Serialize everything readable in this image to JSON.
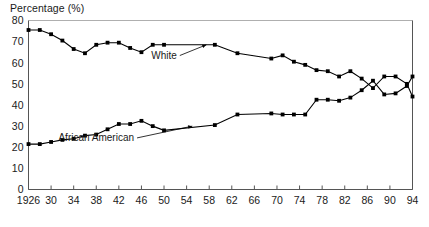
{
  "chart_data": {
    "type": "line",
    "title": "",
    "ylabel": "Percentage (%)",
    "xlabel": "",
    "ylim": [
      0,
      80
    ],
    "ytick_step": 10,
    "yticks": [
      "0",
      "10",
      "20",
      "30",
      "40",
      "50",
      "60",
      "70",
      "80"
    ],
    "xlim": [
      1926,
      1994
    ],
    "xticks": [
      "1926",
      "30",
      "34",
      "38",
      "42",
      "46",
      "50",
      "54",
      "58",
      "62",
      "66",
      "70",
      "74",
      "78",
      "82",
      "86",
      "90",
      "94"
    ],
    "xtick_values": [
      1926,
      1930,
      1934,
      1938,
      1942,
      1946,
      1950,
      1954,
      1958,
      1962,
      1966,
      1970,
      1974,
      1978,
      1982,
      1986,
      1990,
      1994
    ],
    "grid": false,
    "legend_position": "inline-annotation",
    "marker": "square",
    "line_color": "#000000",
    "series": [
      {
        "name": "White",
        "label": "White",
        "x": [
          1926,
          1928,
          1930,
          1932,
          1934,
          1936,
          1938,
          1940,
          1942,
          1944,
          1946,
          1948,
          1950,
          1959,
          1963,
          1969,
          1971,
          1973,
          1975,
          1977,
          1979,
          1981,
          1983,
          1985,
          1987,
          1989,
          1991,
          1993,
          1994
        ],
        "values": [
          75.5,
          75.5,
          73.5,
          70.5,
          66.5,
          64.5,
          68.5,
          69.5,
          69.5,
          67,
          65,
          68.5,
          68.5,
          68.5,
          64.5,
          62,
          63.5,
          60.5,
          59,
          56.5,
          56,
          53.5,
          56,
          52.5,
          48,
          53.5,
          53.5,
          50,
          44
        ]
      },
      {
        "name": "African American",
        "label": "African American",
        "x": [
          1926,
          1928,
          1930,
          1932,
          1934,
          1936,
          1938,
          1940,
          1942,
          1944,
          1946,
          1948,
          1950,
          1959,
          1963,
          1969,
          1971,
          1973,
          1975,
          1977,
          1979,
          1981,
          1983,
          1985,
          1987,
          1989,
          1991,
          1993,
          1994
        ],
        "values": [
          21.5,
          21.5,
          22.5,
          23.5,
          24,
          25.5,
          26,
          28.5,
          31,
          31,
          32.5,
          30,
          28,
          30.5,
          35.5,
          36,
          35.5,
          35.5,
          35.5,
          42.5,
          42.5,
          42,
          43.5,
          47,
          51.5,
          45,
          45.5,
          49,
          53.5
        ]
      }
    ],
    "annotations": [
      {
        "text": "White",
        "label_x": 1950,
        "label_y": 62,
        "arrow_to_x": 1957.5,
        "arrow_to_y": 68.5
      },
      {
        "text": "African American",
        "label_x": 1938,
        "label_y": 23,
        "arrow_to_x": 1955,
        "arrow_to_y": 30
      }
    ]
  },
  "figure": {
    "y_axis_title": "Percentage (%)",
    "note": ""
  }
}
